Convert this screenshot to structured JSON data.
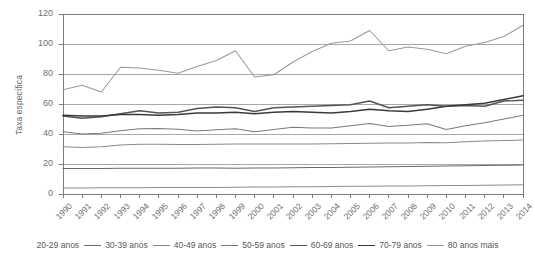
{
  "chart_data": {
    "type": "line",
    "title": "",
    "xlabel": "",
    "ylabel": "Taxa específica",
    "ylim": [
      0,
      120
    ],
    "yticks": [
      0,
      20,
      40,
      60,
      80,
      100,
      120
    ],
    "grid": true,
    "legend_position": "bottom",
    "x": [
      "1990",
      "1991",
      "1992",
      "1993",
      "1994",
      "1995",
      "1996",
      "1997",
      "1998",
      "1999",
      "2000",
      "2001",
      "2002",
      "2003",
      "2004",
      "2005",
      "2006",
      "2007",
      "2008",
      "2009",
      "2010",
      "2011",
      "2012",
      "2013",
      "2014"
    ],
    "series": [
      {
        "name": "20-29 anos",
        "color": "#8d8d8d",
        "values": [
          4.0,
          4.0,
          4.1,
          4.2,
          4.2,
          4.3,
          4.3,
          4.4,
          4.4,
          4.5,
          4.6,
          4.7,
          4.8,
          4.9,
          5.0,
          5.1,
          5.2,
          5.3,
          5.4,
          5.5,
          5.6,
          5.7,
          5.9,
          6.0,
          6.1
        ]
      },
      {
        "name": "30-39 anos",
        "color": "#6a6a6a",
        "values": [
          17.0,
          17.0,
          17.0,
          17.1,
          17.2,
          17.2,
          17.2,
          17.3,
          17.3,
          17.2,
          17.3,
          17.4,
          17.5,
          17.6,
          17.7,
          17.8,
          18.0,
          18.1,
          18.3,
          18.5,
          18.6,
          18.8,
          19.0,
          19.2,
          19.4
        ]
      },
      {
        "name": "40-49 anos",
        "color": "#8a8a8a",
        "values": [
          31.5,
          31.0,
          31.5,
          32.6,
          33.2,
          33.2,
          33.0,
          33.0,
          33.2,
          33.3,
          33.3,
          33.3,
          33.4,
          33.4,
          33.5,
          33.6,
          33.8,
          34.0,
          34.0,
          34.3,
          34.2,
          34.8,
          35.3,
          35.6,
          36.0
        ]
      },
      {
        "name": "50-59 anos",
        "color": "#7a7a7a",
        "values": [
          41.5,
          40.0,
          40.5,
          42.2,
          43.5,
          43.6,
          43.2,
          42.0,
          42.8,
          43.5,
          41.5,
          43.0,
          44.5,
          44.0,
          44.0,
          45.5,
          47.0,
          45.0,
          45.8,
          46.8,
          43.0,
          45.5,
          47.5,
          50.0,
          52.5
        ]
      },
      {
        "name": "60-69 anos",
        "color": "#555555",
        "values": [
          52.0,
          50.5,
          51.5,
          53.5,
          55.5,
          54.0,
          54.5,
          57.0,
          58.0,
          57.5,
          55.0,
          57.5,
          58.0,
          58.5,
          59.0,
          59.5,
          62.0,
          57.5,
          58.5,
          59.5,
          58.5,
          59.0,
          58.5,
          62.0,
          62.5
        ]
      },
      {
        "name": "70-79 anos",
        "color": "#3a3a3a",
        "values": [
          52.5,
          52.0,
          52.0,
          53.0,
          53.0,
          52.5,
          53.0,
          54.0,
          54.0,
          54.5,
          53.5,
          54.5,
          55.0,
          54.5,
          54.0,
          55.0,
          56.5,
          55.5,
          55.0,
          56.5,
          58.5,
          59.5,
          60.5,
          63.0,
          65.5
        ]
      },
      {
        "name": "80 anos mais",
        "color": "#9a9a9a",
        "values": [
          69.5,
          72.5,
          68.0,
          84.5,
          84.0,
          82.5,
          80.5,
          85.0,
          89.0,
          95.5,
          78.0,
          79.5,
          88.0,
          95.0,
          100.5,
          102.0,
          109.0,
          95.5,
          98.0,
          96.5,
          93.5,
          98.5,
          101.0,
          105.0,
          112.5
        ]
      }
    ]
  },
  "axes": {
    "yticks": [
      "0",
      "20",
      "40",
      "60",
      "80",
      "100",
      "120"
    ],
    "xticks": [
      "1990",
      "1991",
      "1992",
      "1993",
      "1994",
      "1995",
      "1996",
      "1997",
      "1998",
      "1999",
      "2000",
      "2001",
      "2002",
      "2003",
      "2004",
      "2005",
      "2006",
      "2007",
      "2008",
      "2009",
      "2010",
      "2011",
      "2012",
      "2013",
      "2014"
    ],
    "ylabel": "Taxa específica"
  },
  "legend": {
    "items": [
      {
        "label": "20-29 anos",
        "color": "#8d8d8d"
      },
      {
        "label": "30-39 anos",
        "color": "#6a6a6a"
      },
      {
        "label": "40-49 anos",
        "color": "#8a8a8a"
      },
      {
        "label": "50-59 anos",
        "color": "#7a7a7a"
      },
      {
        "label": "60-69 anos",
        "color": "#555555"
      },
      {
        "label": "70-79 anos",
        "color": "#3a3a3a"
      },
      {
        "label": "80 anos mais",
        "color": "#9a9a9a"
      }
    ]
  },
  "style": {
    "grid_color": "#a8a8a8",
    "axis_color": "#7d7d7d",
    "text_color": "#6f6f71"
  }
}
